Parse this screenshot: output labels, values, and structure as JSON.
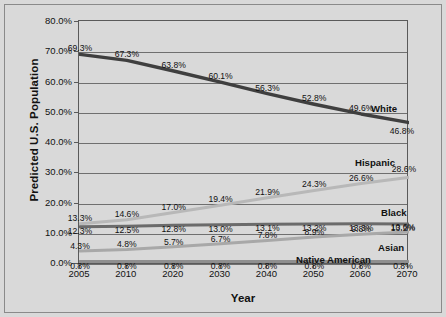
{
  "chart_data": {
    "type": "line",
    "title": "",
    "xlabel": "Year",
    "ylabel": "Predicted U.S. Population",
    "categories": [
      "2005",
      "2010",
      "2020",
      "2030",
      "2040",
      "2050",
      "2060",
      "2070"
    ],
    "x": [
      2005,
      2010,
      2020,
      2030,
      2040,
      2050,
      2060,
      2070
    ],
    "ylim": [
      0,
      80
    ],
    "ytick_labels": [
      "0.0%",
      "10.0%",
      "20.0%",
      "30.0%",
      "40.0%",
      "50.0%",
      "60.0%",
      "70.0%",
      "80.0%"
    ],
    "ytick_values": [
      0,
      10,
      20,
      30,
      40,
      50,
      60,
      70,
      80
    ],
    "grid": "horizontal",
    "legend": "inline-right-of-series",
    "series": [
      {
        "name": "White",
        "color": "#3f3f3f",
        "values": [
          69.3,
          67.3,
          63.8,
          60.1,
          56.3,
          52.8,
          49.6,
          46.8
        ],
        "labels": [
          "69.3%",
          "67.3%",
          "63.8%",
          "60.1%",
          "56.3%",
          "52.8%",
          "49.6%",
          "46.8%"
        ]
      },
      {
        "name": "Hispanic",
        "color": "#b8b8b8",
        "values": [
          13.3,
          14.6,
          17.0,
          19.4,
          21.9,
          24.3,
          26.6,
          28.6
        ],
        "labels": [
          "13.3%",
          "14.6%",
          "17.0%",
          "19.4%",
          "21.9%",
          "24.3%",
          "26.6%",
          "28.6%"
        ]
      },
      {
        "name": "Black",
        "color": "#6b6b6b",
        "values": [
          12.3,
          12.5,
          12.8,
          13.0,
          13.1,
          13.2,
          13.3,
          13.2
        ],
        "labels": [
          "12.3%",
          "12.5%",
          "12.8%",
          "13.0%",
          "13.1%",
          "13.2%",
          "13.3%",
          "13.2%"
        ]
      },
      {
        "name": "Asian",
        "color": "#a8a8a8",
        "values": [
          4.3,
          4.8,
          5.7,
          6.7,
          7.8,
          8.9,
          9.8,
          10.6
        ],
        "labels": [
          "4.3%",
          "4.8%",
          "5.7%",
          "6.7%",
          "7.8%",
          "8.9%",
          "9.8%",
          "10.6%"
        ]
      },
      {
        "name": "Native American",
        "color": "#8f8f8f",
        "values": [
          0.8,
          0.8,
          0.8,
          0.8,
          0.8,
          0.8,
          0.8,
          0.8
        ],
        "labels": [
          "0.8%",
          "0.8%",
          "0.8%",
          "0.8%",
          "0.8%",
          "0.8%",
          "0.8%",
          "0.8%"
        ]
      }
    ],
    "series_label_positions": [
      {
        "name": "White",
        "x_px": 371,
        "y_px": 103
      },
      {
        "name": "Hispanic",
        "x_px": 355,
        "y_px": 157
      },
      {
        "name": "Black",
        "x_px": 381,
        "y_px": 207
      },
      {
        "name": "Asian",
        "x_px": 378,
        "y_px": 242
      },
      {
        "name": "Native American",
        "x_px": 296,
        "y_px": 254
      }
    ],
    "colors": {
      "background": "#d9d9d9",
      "frame": "#5a5a5a",
      "gridline": "#6f6f6f",
      "text": "#111111"
    }
  }
}
